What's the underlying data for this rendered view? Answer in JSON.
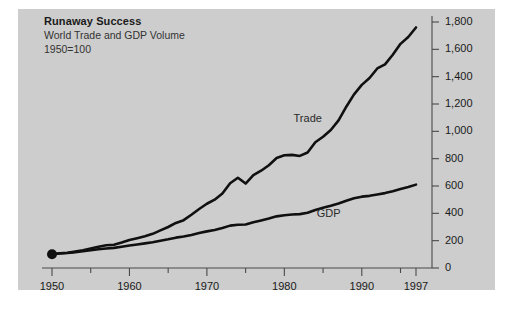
{
  "chart_data": {
    "type": "line",
    "title": "Runaway Success",
    "subtitle": "World Trade and GDP Volume",
    "basenote": "1950=100",
    "xlabel": "",
    "ylabel": "",
    "xlim": [
      1950,
      1997
    ],
    "ylim": [
      0,
      1800
    ],
    "grid": false,
    "legend_position": "inline-annotation",
    "y_ticks": [
      "0",
      "200",
      "400",
      "600",
      "800",
      "1,000",
      "1,200",
      "1,400",
      "1,600",
      "1,800"
    ],
    "y_tick_values": [
      0,
      200,
      400,
      600,
      800,
      1000,
      1200,
      1400,
      1600,
      1800
    ],
    "x_ticks": [
      "1950",
      "1960",
      "1970",
      "1980",
      "1990",
      "1997"
    ],
    "x_tick_values": [
      1950,
      1960,
      1970,
      1980,
      1990,
      1997
    ],
    "x_minor_ticks": [
      1955,
      1965,
      1975,
      1985,
      1995
    ],
    "annotations": [
      {
        "text": "Trade",
        "x": 1983,
        "y": 1080
      },
      {
        "text": "GDP",
        "x": 1986,
        "y": 390
      }
    ],
    "series": [
      {
        "name": "Trade",
        "x": [
          1950,
          1951,
          1952,
          1953,
          1954,
          1955,
          1956,
          1957,
          1958,
          1959,
          1960,
          1961,
          1962,
          1963,
          1964,
          1965,
          1966,
          1967,
          1968,
          1969,
          1970,
          1971,
          1972,
          1973,
          1974,
          1975,
          1976,
          1977,
          1978,
          1979,
          1980,
          1981,
          1982,
          1983,
          1984,
          1985,
          1986,
          1987,
          1988,
          1989,
          1990,
          1991,
          1992,
          1993,
          1994,
          1995,
          1996,
          1997
        ],
        "values": [
          100,
          108,
          112,
          120,
          130,
          142,
          155,
          166,
          170,
          186,
          205,
          218,
          232,
          250,
          275,
          300,
          330,
          350,
          390,
          432,
          470,
          500,
          545,
          620,
          660,
          618,
          680,
          712,
          752,
          805,
          825,
          828,
          820,
          845,
          920,
          960,
          1010,
          1080,
          1180,
          1270,
          1340,
          1390,
          1460,
          1490,
          1560,
          1640,
          1690,
          1760
        ]
      },
      {
        "name": "GDP",
        "x": [
          1950,
          1951,
          1952,
          1953,
          1954,
          1955,
          1956,
          1957,
          1958,
          1959,
          1960,
          1961,
          1962,
          1963,
          1964,
          1965,
          1966,
          1967,
          1968,
          1969,
          1970,
          1971,
          1972,
          1973,
          1974,
          1975,
          1976,
          1977,
          1978,
          1979,
          1980,
          1981,
          1982,
          1983,
          1984,
          1985,
          1986,
          1987,
          1988,
          1989,
          1990,
          1991,
          1992,
          1993,
          1994,
          1995,
          1996,
          1997
        ],
        "values": [
          100,
          106,
          110,
          116,
          122,
          130,
          137,
          143,
          147,
          155,
          164,
          172,
          180,
          188,
          200,
          210,
          222,
          230,
          242,
          256,
          268,
          278,
          292,
          310,
          316,
          318,
          335,
          348,
          362,
          378,
          386,
          392,
          394,
          404,
          424,
          440,
          455,
          472,
          492,
          510,
          522,
          528,
          538,
          548,
          562,
          578,
          592,
          610
        ]
      }
    ]
  }
}
